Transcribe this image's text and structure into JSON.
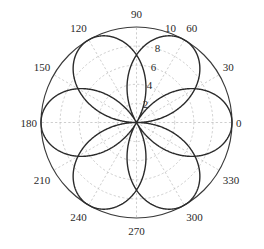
{
  "figure": {
    "background_color": "#ffffff",
    "outer_circle_color": "#3a3a3a",
    "grid_color": "#b9b9b9",
    "curve_color": "#2b2b2b",
    "label_color": "#2a2a2a"
  },
  "chart_data": {
    "type": "line",
    "projection": "polar",
    "title": "",
    "xlabel": "",
    "ylabel": "",
    "grid": true,
    "legend": null,
    "angle_unit": "degrees",
    "theta_direction": "counterclockwise",
    "theta_zero_location": "E",
    "rlim": [
      0,
      10
    ],
    "r_ticks": [
      2,
      4,
      6,
      8,
      10
    ],
    "r_tick_labels": [
      "2",
      "4",
      "6",
      "8",
      "10"
    ],
    "r_tick_label_angle_deg": 78,
    "theta_ticks": [
      0,
      30,
      60,
      90,
      120,
      150,
      180,
      210,
      240,
      270,
      300,
      330
    ],
    "theta_tick_labels": [
      "0",
      "30",
      "60",
      "90",
      "120",
      "150",
      "180",
      "210",
      "240",
      "270",
      "300",
      "330"
    ],
    "series": [
      {
        "name": "three-petal rose",
        "equation": "r = 10*cos(1.5*theta)",
        "petal_count": 3,
        "petal_peak_angles_deg": [
          0,
          120,
          240
        ],
        "petal_peak_radius": 10,
        "samples": [
          {
            "theta_deg": 0,
            "r": 10.0
          },
          {
            "theta_deg": 10,
            "r": 9.659
          },
          {
            "theta_deg": 20,
            "r": 8.66
          },
          {
            "theta_deg": 30,
            "r": 7.071
          },
          {
            "theta_deg": 40,
            "r": 5.0
          },
          {
            "theta_deg": 50,
            "r": 2.588
          },
          {
            "theta_deg": 60,
            "r": 0.0
          },
          {
            "theta_deg": 80,
            "r": 5.0
          },
          {
            "theta_deg": 100,
            "r": 8.66
          },
          {
            "theta_deg": 120,
            "r": 10.0
          },
          {
            "theta_deg": 140,
            "r": 8.66
          },
          {
            "theta_deg": 160,
            "r": 5.0
          },
          {
            "theta_deg": 180,
            "r": 0.0
          },
          {
            "theta_deg": 200,
            "r": 5.0
          },
          {
            "theta_deg": 220,
            "r": 8.66
          },
          {
            "theta_deg": 240,
            "r": 10.0
          },
          {
            "theta_deg": 260,
            "r": 8.66
          },
          {
            "theta_deg": 280,
            "r": 5.0
          },
          {
            "theta_deg": 300,
            "r": 0.0
          },
          {
            "theta_deg": 320,
            "r": 5.0
          },
          {
            "theta_deg": 340,
            "r": 8.66
          },
          {
            "theta_deg": 360,
            "r": 10.0
          }
        ]
      }
    ]
  }
}
